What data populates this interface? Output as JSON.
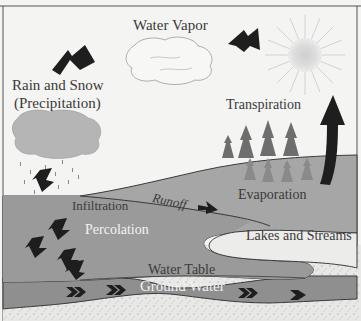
{
  "labels": {
    "water_vapor": "Water Vapor",
    "rain_snow_line1": "Rain and Snow",
    "rain_snow_line2": "(Precipitation)",
    "transpiration": "Transpiration",
    "runoff": "Runoff",
    "infiltration": "Infiltration",
    "evaporation": "Evaporation",
    "percolation": "Percolation",
    "lakes_streams": "Lakes and Streams",
    "water_table": "Water Table",
    "ground_water": "Ground Water"
  },
  "colors": {
    "sky": "#f4f4f2",
    "land": "#a6a6a6",
    "soil": "#e8e8e6",
    "groundwater": "#8f8f8f",
    "lake": "#ececea",
    "arrow": "#1e1e1e",
    "sun": "#d6d6d6",
    "tree": "#6e6e6e"
  }
}
